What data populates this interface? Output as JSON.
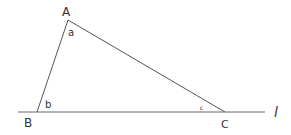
{
  "diagram": {
    "type": "triangle-on-line",
    "points": {
      "A": {
        "label": "A",
        "x": 68,
        "y": 20
      },
      "B": {
        "label": "B",
        "x": 37,
        "y": 112
      },
      "C": {
        "label": "C",
        "x": 225,
        "y": 112
      }
    },
    "angles": {
      "a": {
        "label": "a",
        "at": "A"
      },
      "b": {
        "label": "b",
        "at": "B"
      },
      "c": {
        "label": "c",
        "at": "C"
      }
    },
    "line": {
      "label": "l",
      "x1": 18,
      "x2": 265,
      "y": 112
    },
    "stroke_color": "#555555"
  }
}
